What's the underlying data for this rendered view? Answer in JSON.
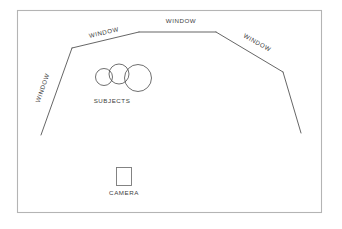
{
  "diagram": {
    "background_color": "#ffffff",
    "frame_color": "#b4b4b4",
    "line_color": "#4a4a4a",
    "text_color": "#3d3d3d",
    "labels": {
      "window_left": "WINDOW",
      "window_top_left": "WINDOW",
      "window_top_center": "WINDOW",
      "window_right": "WINDOW",
      "subjects": "SUBJECTS",
      "camera": "CAMERA"
    },
    "walls": [
      {
        "name": "left-window-wall",
        "points": "41,135 72,48",
        "label": "WINDOW"
      },
      {
        "name": "top-left-window-wall",
        "points": "72,48 139,32",
        "label": "WINDOW"
      },
      {
        "name": "top-center-window-wall",
        "points": "139,32 216,32",
        "label": "WINDOW"
      },
      {
        "name": "right-window-wall",
        "points": "216,32 283,72",
        "label": "WINDOW"
      },
      {
        "name": "right-lower-wall",
        "points": "283,72 301,133",
        "label": ""
      }
    ],
    "subjects": [
      {
        "name": "subject-small",
        "cx": 104,
        "cy": 77,
        "r": 8.5
      },
      {
        "name": "subject-medium",
        "cx": 119,
        "cy": 74,
        "r": 10.0
      },
      {
        "name": "subject-large",
        "cx": 138,
        "cy": 78,
        "r": 13.5
      }
    ],
    "camera": {
      "x": 116,
      "y": 167,
      "width": 16,
      "height": 19
    },
    "frame": {
      "x": 17,
      "y": 10,
      "width": 305,
      "height": 203
    }
  }
}
